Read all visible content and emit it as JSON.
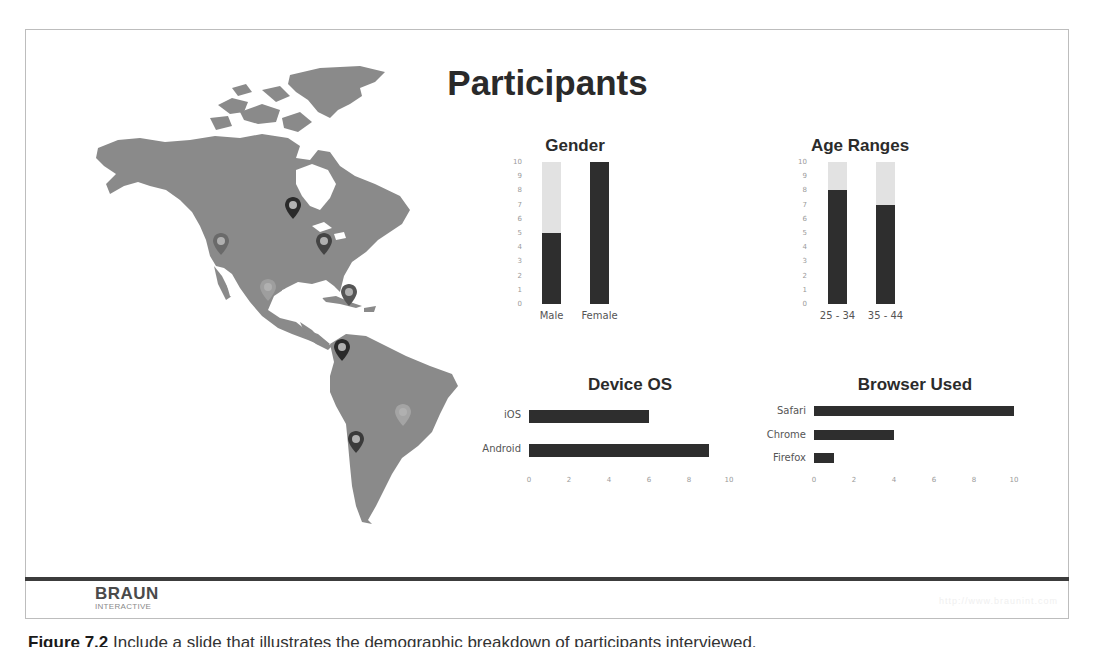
{
  "slide": {
    "title": "Participants",
    "footer": {
      "logo_main": "BRAUN",
      "logo_sub": "INTERACTIVE",
      "url": "http://www.braunint.com"
    }
  },
  "caption": {
    "label": "Figure 7.2",
    "text": "Include a slide that illustrates the demographic breakdown of participants interviewed."
  },
  "map": {
    "region": "Americas",
    "fill_color": "#8a8a8a",
    "pins": [
      {
        "x": 293,
        "y": 208,
        "shade": "#2a2a2a"
      },
      {
        "x": 221,
        "y": 244,
        "shade": "#6a6a6a"
      },
      {
        "x": 324,
        "y": 244,
        "shade": "#444444"
      },
      {
        "x": 268,
        "y": 290,
        "shade": "#9e9e9e"
      },
      {
        "x": 349,
        "y": 295,
        "shade": "#555555"
      },
      {
        "x": 342,
        "y": 350,
        "shade": "#2a2a2a"
      },
      {
        "x": 403,
        "y": 415,
        "shade": "#a4a4a4"
      },
      {
        "x": 356,
        "y": 442,
        "shade": "#3a3a3a"
      }
    ]
  },
  "chart_data": [
    {
      "type": "bar",
      "orientation": "vertical",
      "title": "Gender",
      "categories": [
        "Male",
        "Female"
      ],
      "values": [
        5,
        10
      ],
      "ylim": [
        0,
        10
      ],
      "yticks": [
        "0",
        "1",
        "2",
        "3",
        "4",
        "5",
        "6",
        "7",
        "8",
        "9",
        "10"
      ],
      "background_track": true,
      "colors": {
        "bar": "#2e2e2e",
        "track": "#e2e2e2"
      }
    },
    {
      "type": "bar",
      "orientation": "vertical",
      "title": "Age Ranges",
      "categories": [
        "25 - 34",
        "35 - 44"
      ],
      "values": [
        8,
        7
      ],
      "ylim": [
        0,
        10
      ],
      "yticks": [
        "0",
        "1",
        "2",
        "3",
        "4",
        "5",
        "6",
        "7",
        "8",
        "9",
        "10"
      ],
      "background_track": true,
      "colors": {
        "bar": "#2e2e2e",
        "track": "#e2e2e2"
      }
    },
    {
      "type": "bar",
      "orientation": "horizontal",
      "title": "Device OS",
      "categories": [
        "iOS",
        "Android"
      ],
      "values": [
        6,
        9
      ],
      "xlim": [
        0,
        10
      ],
      "xticks": [
        "0",
        "2",
        "4",
        "6",
        "8",
        "10"
      ],
      "colors": {
        "bar": "#2e2e2e"
      }
    },
    {
      "type": "bar",
      "orientation": "horizontal",
      "title": "Browser Used",
      "categories": [
        "Safari",
        "Chrome",
        "Firefox"
      ],
      "values": [
        10,
        4,
        1
      ],
      "xlim": [
        0,
        10
      ],
      "xticks": [
        "0",
        "2",
        "4",
        "6",
        "8",
        "10"
      ],
      "colors": {
        "bar": "#2e2e2e"
      }
    }
  ]
}
